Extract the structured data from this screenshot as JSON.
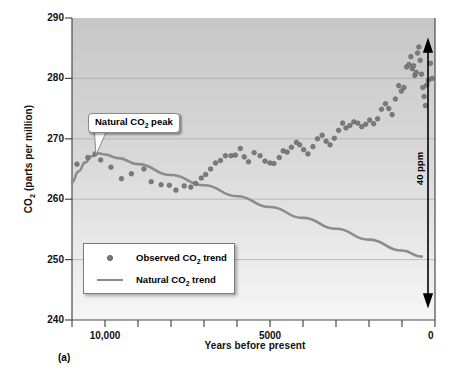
{
  "figure": {
    "panel_letter": "(a)",
    "background_top_color": "#c9c9c9",
    "background_bottom_color": "#f4f4f4",
    "trend_line_color": "#8c8c8c",
    "point_color": "#7c7c7c",
    "axis_color": "#4a4a4a"
  },
  "annotations": {
    "callout_label_pre": "Natural CO",
    "callout_label_sub": "2",
    "callout_label_post": " peak",
    "ppm_arrow_label": "40 ppm"
  },
  "legend": {
    "items": [
      {
        "key": "dot",
        "label_pre": "Observed CO",
        "label_sub": "2",
        "label_post": " trend"
      },
      {
        "key": "line",
        "label_pre": "Natural CO",
        "label_sub": "2",
        "label_post": " trend"
      }
    ]
  },
  "chart_data": {
    "type": "scatter",
    "title": "",
    "xlabel": "Years before present",
    "ylabel_pre": "CO",
    "ylabel_sub": "2",
    "ylabel_post": " (parts per million)",
    "ylabel": "CO2 (parts per million)",
    "xlim": [
      11000,
      0
    ],
    "ylim": [
      240,
      290
    ],
    "x_axis_reversed": true,
    "grid": "horizontal",
    "yticks": [
      240,
      250,
      260,
      270,
      280,
      290
    ],
    "ytick_labels": [
      "240",
      "250",
      "260",
      "270",
      "280",
      "290"
    ],
    "xticks": [
      11000,
      10000,
      9000,
      8000,
      7000,
      6000,
      5000,
      4000,
      3000,
      2000,
      1000,
      0
    ],
    "xtick_labels_shown": {
      "10000": "10,000",
      "5000": "5000",
      "0": "0"
    },
    "series": [
      {
        "name": "Observed CO2 trend",
        "type": "scatter",
        "marker": "circle",
        "color": "#7c7c7c",
        "points": [
          [
            10850,
            265.8
          ],
          [
            10520,
            266.9
          ],
          [
            10300,
            267.5
          ],
          [
            10130,
            266.5
          ],
          [
            9820,
            265.3
          ],
          [
            9500,
            263.4
          ],
          [
            9200,
            264.2
          ],
          [
            8820,
            265.0
          ],
          [
            8600,
            262.9
          ],
          [
            8300,
            262.4
          ],
          [
            8050,
            262.3
          ],
          [
            7850,
            261.5
          ],
          [
            7600,
            262.2
          ],
          [
            7400,
            262.0
          ],
          [
            7250,
            262.6
          ],
          [
            7080,
            263.5
          ],
          [
            6950,
            264.1
          ],
          [
            6800,
            265.0
          ],
          [
            6650,
            266.0
          ],
          [
            6500,
            266.4
          ],
          [
            6350,
            267.2
          ],
          [
            6180,
            267.2
          ],
          [
            6050,
            267.3
          ],
          [
            5900,
            268.4
          ],
          [
            5780,
            267.0
          ],
          [
            5650,
            266.2
          ],
          [
            5480,
            267.7
          ],
          [
            5300,
            267.2
          ],
          [
            5150,
            266.3
          ],
          [
            5000,
            266.0
          ],
          [
            4880,
            265.9
          ],
          [
            4720,
            266.9
          ],
          [
            4600,
            268.0
          ],
          [
            4480,
            267.8
          ],
          [
            4350,
            268.6
          ],
          [
            4200,
            269.4
          ],
          [
            4100,
            269.0
          ],
          [
            3980,
            268.2
          ],
          [
            3850,
            267.5
          ],
          [
            3700,
            268.7
          ],
          [
            3560,
            270.0
          ],
          [
            3420,
            270.6
          ],
          [
            3300,
            269.6
          ],
          [
            3180,
            269.0
          ],
          [
            3050,
            270.1
          ],
          [
            2920,
            271.4
          ],
          [
            2800,
            272.6
          ],
          [
            2700,
            271.8
          ],
          [
            2580,
            272.2
          ],
          [
            2460,
            272.8
          ],
          [
            2340,
            272.6
          ],
          [
            2220,
            272.0
          ],
          [
            2100,
            272.4
          ],
          [
            1980,
            273.1
          ],
          [
            1860,
            272.5
          ],
          [
            1740,
            273.3
          ],
          [
            1620,
            274.9
          ],
          [
            1500,
            275.8
          ],
          [
            1400,
            275.0
          ],
          [
            1300,
            274.0
          ],
          [
            1200,
            276.6
          ],
          [
            1100,
            278.8
          ],
          [
            1020,
            277.9
          ],
          [
            940,
            278.5
          ],
          [
            860,
            281.9
          ],
          [
            790,
            282.3
          ],
          [
            730,
            283.6
          ],
          [
            690,
            281.6
          ],
          [
            650,
            282.1
          ],
          [
            610,
            280.5
          ],
          [
            570,
            281.0
          ],
          [
            530,
            284.2
          ],
          [
            490,
            285.2
          ],
          [
            450,
            283.0
          ],
          [
            410,
            280.7
          ],
          [
            370,
            278.5
          ],
          [
            330,
            277.0
          ],
          [
            290,
            275.5
          ],
          [
            250,
            278.9
          ],
          [
            200,
            279.7
          ],
          [
            140,
            282.5
          ],
          [
            90,
            280.0
          ]
        ]
      },
      {
        "name": "Natural CO2 trend",
        "type": "line",
        "color": "#8c8c8c",
        "points": [
          [
            11000,
            262.8
          ],
          [
            10800,
            264.6
          ],
          [
            10600,
            266.1
          ],
          [
            10400,
            267.1
          ],
          [
            10200,
            267.6
          ],
          [
            10000,
            267.4
          ],
          [
            9600,
            266.8
          ],
          [
            9000,
            265.8
          ],
          [
            8000,
            264.0
          ],
          [
            7000,
            262.3
          ],
          [
            6000,
            260.5
          ],
          [
            5000,
            258.7
          ],
          [
            4000,
            256.9
          ],
          [
            3000,
            255.1
          ],
          [
            2000,
            253.3
          ],
          [
            1000,
            251.5
          ],
          [
            400,
            250.5
          ]
        ]
      }
    ],
    "annotation_arrow": {
      "label": "40 ppm",
      "from_ppm": 285,
      "to_ppm": 245,
      "at_years": 250,
      "double_headed": true
    }
  }
}
